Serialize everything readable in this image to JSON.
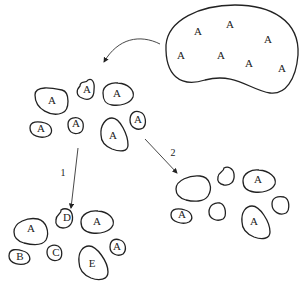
{
  "diagram": {
    "source_population": {
      "labels": [
        "A",
        "A",
        "A",
        "A",
        "A",
        "A",
        "A"
      ]
    },
    "step_initial": {
      "labels": [
        "A",
        "A",
        "A",
        "A",
        "A",
        "A",
        "A",
        "A"
      ]
    },
    "arrows": {
      "path_1_label": "1",
      "path_2_label": "2"
    },
    "result_1": {
      "labels": [
        "A",
        "D",
        "A",
        "B",
        "C",
        "E",
        "A"
      ]
    },
    "result_2": {
      "labels": [
        "A",
        "A",
        "A"
      ]
    }
  }
}
